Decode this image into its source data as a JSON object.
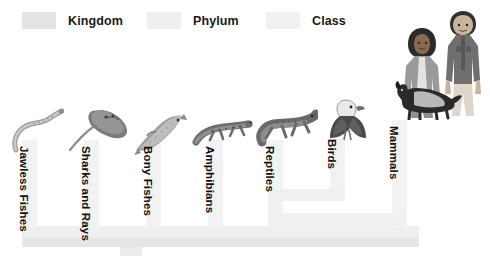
{
  "legend": {
    "items": [
      {
        "label": "Kingdom",
        "color": "#e4e4e4",
        "icon": "legend-swatch-icon"
      },
      {
        "label": "Phylum",
        "color": "#efefef",
        "icon": "legend-swatch-icon"
      },
      {
        "label": "Class",
        "color": "#f1f1f1",
        "icon": "legend-swatch-icon"
      }
    ]
  },
  "diagram": {
    "title": "",
    "type": "taxonomy-bracket",
    "clades": [
      {
        "label": "Jawless Fishes",
        "icon": "lamprey-illustration"
      },
      {
        "label": "Sharks and Rays",
        "icon": "stingray-illustration"
      },
      {
        "label": "Bony Fishes",
        "icon": "trout-illustration"
      },
      {
        "label": "Amphibians",
        "icon": "salamander-illustration"
      },
      {
        "label": "Reptiles",
        "icon": "lizard-illustration"
      },
      {
        "label": "Birds",
        "icon": "eagle-illustration"
      },
      {
        "label": "Mammals",
        "icon": "humans-and-dog-illustration"
      }
    ]
  }
}
